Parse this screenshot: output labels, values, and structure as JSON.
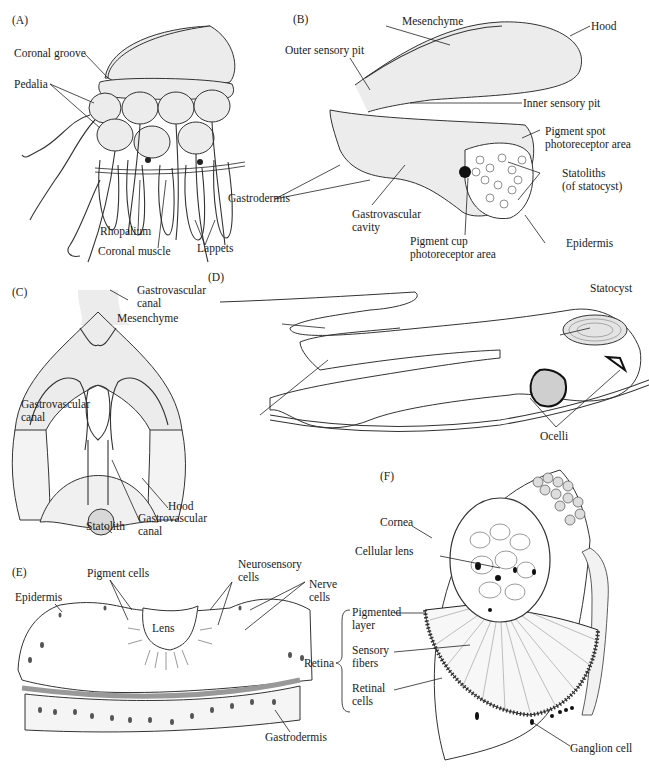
{
  "figure": {
    "panels": [
      {
        "id": "A",
        "tag": "(A)",
        "labels": [
          "Coronal groove",
          "Pedalia",
          "Rhopalium",
          "Coronal muscle",
          "Lappets"
        ]
      },
      {
        "id": "B",
        "tag": "(B)",
        "labels": [
          "Mesenchyme",
          "Hood",
          "Outer sensory pit",
          "Inner sensory pit",
          "Pigment spot",
          "photoreceptor area",
          "Statoliths",
          "(of statocyst)",
          "Gastrodermis",
          "Gastrovascular",
          "cavity",
          "Pigment cup",
          "photoreceptor area",
          "Epidermis"
        ]
      },
      {
        "id": "C",
        "tag": "(C)",
        "labels": [
          "Gastrovascular",
          "canal",
          "Hood",
          "Statolith",
          "Gastrovascular",
          "canal"
        ]
      },
      {
        "id": "D",
        "tag": "(D)",
        "labels": [
          "Statocyst",
          "Mesenchyme",
          "Gastrovascular",
          "canal",
          "Ocelli"
        ]
      },
      {
        "id": "E",
        "tag": "(E)",
        "labels": [
          "Pigment cells",
          "Neurosensory",
          "cells",
          "Nerve",
          "cells",
          "Epidermis",
          "Lens",
          "Gastrodermis"
        ]
      },
      {
        "id": "F",
        "tag": "(F)",
        "labels": [
          "Cornea",
          "Cellular lens",
          "Pigmented",
          "layer",
          "Retina",
          "Sensory",
          "fibers",
          "Retinal",
          "cells",
          "Ganglion cell"
        ]
      }
    ]
  }
}
